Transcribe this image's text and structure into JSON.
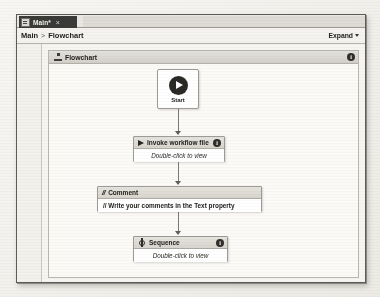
{
  "window": {
    "tab": {
      "label": "Main*",
      "close_label": "×",
      "icon": "document-icon"
    },
    "breadcrumb": {
      "items": [
        "Main",
        "Flowchart"
      ],
      "separator": ">"
    },
    "expand": {
      "label": "Expand",
      "caret": "chevron-down-icon"
    }
  },
  "flowchart": {
    "title": "Flowchart",
    "icon": "flowchart-icon",
    "info_icon": "i",
    "nodes": {
      "start": {
        "label": "Start",
        "icon": "play-circle-icon"
      },
      "invoke": {
        "title": "Invoke workflow file",
        "icon": "play-icon",
        "info_icon": "i",
        "body": "Double-click to view"
      },
      "comment": {
        "title": "Comment",
        "icon": "//",
        "body": "// Write your comments in the Text property"
      },
      "sequence": {
        "title": "Sequence",
        "icon": "sequence-icon",
        "info_icon": "i",
        "body": "Double-click to view"
      }
    }
  },
  "colors": {
    "window_bg": "#f7f6f2",
    "canvas_bg": "#f6f5f1",
    "header_bar": "#d8d6ce",
    "tab_active": "#3a3a38",
    "node_border": "#9d9b95",
    "connector": "#7a7975"
  }
}
